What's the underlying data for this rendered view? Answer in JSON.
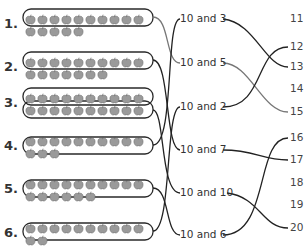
{
  "rows": [
    {
      "label": "1.",
      "tens": 10,
      "ones": 5,
      "y": 12,
      "match": "10 and 5"
    },
    {
      "label": "2.",
      "tens": 10,
      "ones": 7,
      "y": 55,
      "match": "10 and 7"
    },
    {
      "label": "3.",
      "tens": 10,
      "ones": 10,
      "y": 91,
      "match": "10 and 10"
    },
    {
      "label": "4.",
      "tens": 10,
      "ones": 3,
      "y": 134,
      "match": "10 and 3"
    },
    {
      "label": "5.",
      "tens": 10,
      "ones": 6,
      "y": 177,
      "match": "10 and 6"
    },
    {
      "label": "6.",
      "tens": 10,
      "ones": 2,
      "y": 221,
      "match": "10 and 2"
    }
  ],
  "middle_labels": [
    {
      "text": "10 and 3",
      "y": 19,
      "match": "13"
    },
    {
      "text": "10 and 5",
      "y": 63,
      "match": "15"
    },
    {
      "text": "10 and 2",
      "y": 107,
      "match": "12"
    },
    {
      "text": "10 and 7",
      "y": 150,
      "match": "17"
    },
    {
      "text": "10 and 10",
      "y": 193,
      "match": "20"
    },
    {
      "text": "10 and 6",
      "y": 235,
      "match": "16"
    }
  ],
  "numbers": [
    {
      "text": "11",
      "y": 19
    },
    {
      "text": "12",
      "y": 47
    },
    {
      "text": "13",
      "y": 67
    },
    {
      "text": "14",
      "y": 89
    },
    {
      "text": "15",
      "y": 112
    },
    {
      "text": "16",
      "y": 138
    },
    {
      "text": "17",
      "y": 160
    },
    {
      "text": "18",
      "y": 183
    },
    {
      "text": "19",
      "y": 205
    },
    {
      "text": "20",
      "y": 228
    }
  ],
  "colors": {
    "apple_fill": "#9a9a9a",
    "apple_stroke": "#6a6a6a",
    "line_dark": "#222222",
    "line_gray": "#777777"
  }
}
